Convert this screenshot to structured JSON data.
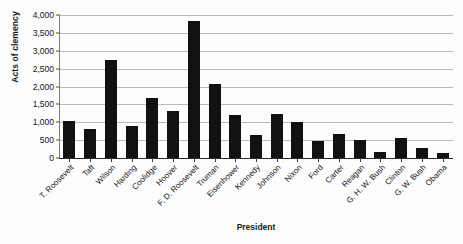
{
  "chart_data": {
    "type": "bar",
    "title": "",
    "xlabel": "President",
    "ylabel": "Acts of clemency",
    "categories": [
      "T. Roosevelt",
      "Taft",
      "Wilson",
      "Harding",
      "Coolidge",
      "Hoover",
      "F. D. Roosevelt",
      "Truman",
      "Eisenhower",
      "Kennedy",
      "Johnson",
      "Nixon",
      "Ford",
      "Carter",
      "Reagan",
      "G. H. W. Bush",
      "Clinton",
      "G. W. Bush",
      "Obama"
    ],
    "values": [
      1030,
      820,
      2750,
      900,
      1670,
      1320,
      3820,
      2080,
      1200,
      630,
      1240,
      1000,
      480,
      660,
      490,
      180,
      550,
      290,
      150
    ],
    "ylim": [
      0,
      4000
    ],
    "yticks": [
      0,
      500,
      1000,
      1500,
      2000,
      2500,
      3000,
      3500,
      4000
    ],
    "ytick_labels": [
      "0",
      "500",
      "1,000",
      "1,500",
      "2,000",
      "2,500",
      "3,000",
      "3,500",
      "4,000"
    ],
    "grid": true,
    "legend": false,
    "bar_color": "#111111",
    "grid_color": "#b9b9b9",
    "axis_color": "#2a2a2a",
    "background_color": "#fdfdfd"
  }
}
